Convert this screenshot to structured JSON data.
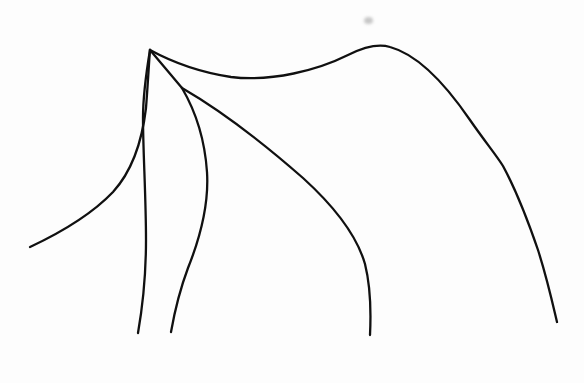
{
  "document": {
    "title": "Line Drawing",
    "medium": "ink-on-paper-sketch",
    "subject": "minimalist contour line drawing of an animal-like form",
    "background_color": "#fdfdfd",
    "ink_color": "#101010",
    "stroke_width_px": 2.3,
    "width_px": 584,
    "height_px": 383
  },
  "artwork": {
    "type": "line-art",
    "stroke_count": 5,
    "apex_point": {
      "x": 150,
      "y": 50
    },
    "secondary_junction": {
      "x": 182,
      "y": 88
    },
    "strokes": [
      {
        "name": "left-outer-sweep",
        "description": "long curve from lower-left tail rising to the apex",
        "start": {
          "x": 30,
          "y": 247
        },
        "end": {
          "x": 150,
          "y": 50
        },
        "path": "M30,247 C62,232 92,214 113,192 C133,170 142,142 146,108 C148,82 149,62 150,50"
      },
      {
        "name": "left-inner-branch",
        "description": "branch descending from apex down the left toward bottom edge",
        "start": {
          "x": 150,
          "y": 50
        },
        "end": {
          "x": 138,
          "y": 333
        },
        "path": "M150,50 C146,74 143,96 143,118 C143,152 146,196 146,240 C146,278 142,310 138,333"
      },
      {
        "name": "top-ridge-curve",
        "description": "upper contour from apex dipping low then cresting at right and descending the right side",
        "start": {
          "x": 150,
          "y": 50
        },
        "end": {
          "x": 557,
          "y": 322
        },
        "path": "M150,50 C172,62 198,72 231,77 C272,82 318,70 348,55 C366,46 380,44 390,47 C416,54 444,82 470,120 C486,143 497,156 503,166 C516,190 527,218 538,250 C547,278 553,305 557,322"
      },
      {
        "name": "apex-to-junction-link",
        "description": "short stroke from apex to the secondary junction point",
        "start": {
          "x": 150,
          "y": 50
        },
        "end": {
          "x": 182,
          "y": 88
        },
        "path": "M150,50 C160,62 172,76 182,88"
      },
      {
        "name": "middle-inner-curve",
        "description": "curve from the secondary junction bulging right then falling to bottom centre-left",
        "start": {
          "x": 182,
          "y": 88
        },
        "end": {
          "x": 171,
          "y": 332
        },
        "path": "M182,88 C196,112 205,142 207,172 C209,204 200,238 188,268 C179,292 174,315 171,332"
      },
      {
        "name": "long-diagonal-curve",
        "description": "long diagonal from the secondary junction sweeping down-right then turning vertical to bottom",
        "start": {
          "x": 182,
          "y": 88
        },
        "end": {
          "x": 370,
          "y": 335
        },
        "path": "M182,88 C220,110 262,142 303,178 C336,208 357,236 365,264 C371,288 371,314 370,335"
      }
    ],
    "artifacts": [
      {
        "name": "paper-smudge",
        "description": "small gray smudge mark on the paper above the ridge crest",
        "x": 364,
        "y": 17,
        "width": 9,
        "height": 7,
        "color": "#9a9a9a"
      }
    ]
  }
}
